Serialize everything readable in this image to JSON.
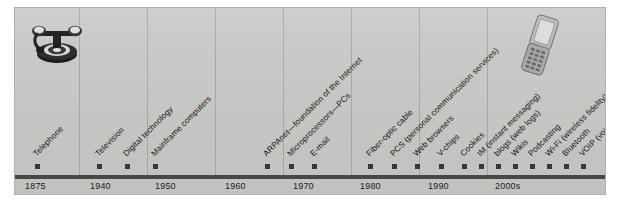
{
  "figure": {
    "panel_color": "#c9c9c7",
    "axis_color": "#4a4a4a",
    "marker_color": "#3a3a3a",
    "text_color": "#141414"
  },
  "images": {
    "left": {
      "name": "antique-rotary-telephone",
      "alt": "Antique rotary dial telephone"
    },
    "right": {
      "name": "flip-cell-phone",
      "alt": "Clamshell flip mobile phone"
    }
  },
  "chart_data": {
    "type": "timeline",
    "xlabel": "",
    "ylabel": "",
    "grid": true,
    "axis_years": [
      {
        "label": "1875",
        "x": 10
      },
      {
        "label": "1940",
        "x": 75
      },
      {
        "label": "1950",
        "x": 140
      },
      {
        "label": "1960",
        "x": 210
      },
      {
        "label": "1970",
        "x": 278
      },
      {
        "label": "1980",
        "x": 345
      },
      {
        "label": "1990",
        "x": 413
      },
      {
        "label": "2000s",
        "x": 480
      }
    ],
    "gridlines": [
      64,
      132,
      200,
      268,
      336,
      404,
      472
    ],
    "events": [
      {
        "label": "Telephone",
        "x": 22,
        "year": "1875"
      },
      {
        "label": "Television",
        "x": 84,
        "year": "1940"
      },
      {
        "label": "Digital technology",
        "x": 112,
        "year": "1940s"
      },
      {
        "label": "Mainframe computers",
        "x": 140,
        "year": "1950"
      },
      {
        "label": "ARPAnet—foundation of the Internet",
        "x": 252,
        "year": "1970"
      },
      {
        "label": "Microprocessors—PCs",
        "x": 276,
        "year": "1970s"
      },
      {
        "label": "E-mail",
        "x": 299,
        "year": "1970s"
      },
      {
        "label": "Fiber-optic cable",
        "x": 355,
        "year": "1980s"
      },
      {
        "label": "PCS (personal communication services)",
        "x": 379,
        "year": "1980s"
      },
      {
        "label": "Web browsers",
        "x": 402,
        "year": "1990"
      },
      {
        "label": "V-chips",
        "x": 426,
        "year": "1990s"
      },
      {
        "label": "Cookies",
        "x": 449,
        "year": "1990s"
      },
      {
        "label": "IM (instant messaging)",
        "x": 466,
        "year": "1990s"
      },
      {
        "label": "blogs (web logs)",
        "x": 483,
        "year": "2000s"
      },
      {
        "label": "Wikis",
        "x": 500,
        "year": "2000s"
      },
      {
        "label": "Podcasting",
        "x": 517,
        "year": "2000s"
      },
      {
        "label": "Wi-Fi (wireless fidelity)",
        "x": 534,
        "year": "2000s"
      },
      {
        "label": "Bluetooth",
        "x": 551,
        "year": "2000s"
      },
      {
        "label": "VOIP (voice over Internet protocol)",
        "x": 568,
        "year": "2000s"
      }
    ]
  }
}
